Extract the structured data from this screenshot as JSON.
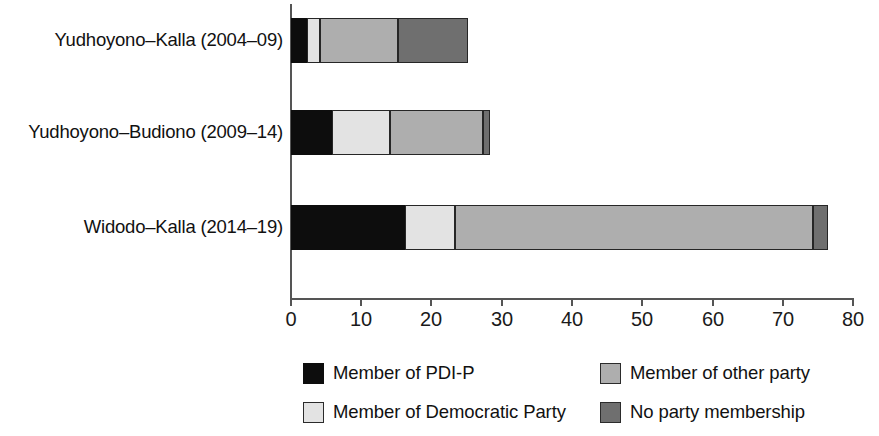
{
  "chart_data": {
    "type": "bar",
    "orientation": "horizontal",
    "stacked": true,
    "title": "",
    "xlabel": "",
    "ylabel": "",
    "xlim": [
      0,
      80
    ],
    "xticks": [
      0,
      10,
      20,
      30,
      40,
      50,
      60,
      70,
      80
    ],
    "xtick_labels": [
      "0",
      "10",
      "20",
      "30",
      "40",
      "50",
      "60",
      "70",
      "80"
    ],
    "grid": false,
    "legend_position": "bottom",
    "categories": [
      "Yudhoyono–Kalla (2004–09)",
      "Yudhoyono–Budiono (2009–14)",
      "Widodo–Kalla (2014–19)"
    ],
    "series": [
      {
        "name": "Member of PDI-P",
        "color": "#0d0d0d",
        "values": [
          2.3,
          5.8,
          16.2
        ]
      },
      {
        "name": "Member of Democratic Party",
        "color": "#e3e3e3",
        "values": [
          1.8,
          8.3,
          7.1
        ]
      },
      {
        "name": "Member of other party",
        "color": "#aeaeae",
        "values": [
          11.1,
          13.2,
          51.0
        ]
      },
      {
        "name": "No party membership",
        "color": "#6f6f6f",
        "values": [
          10.0,
          1.0,
          2.2
        ]
      }
    ],
    "totals": [
      25.2,
      28.3,
      76.5
    ]
  },
  "legend": {
    "items": [
      {
        "label": "Member of PDI-P",
        "swatch": "pdip"
      },
      {
        "label": "Member of Democratic Party",
        "swatch": "democratic"
      },
      {
        "label": "Member of other party",
        "swatch": "other"
      },
      {
        "label": "No party membership",
        "swatch": "noparty"
      }
    ]
  }
}
